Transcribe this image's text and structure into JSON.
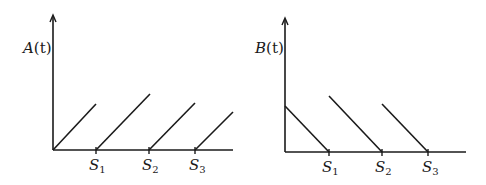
{
  "panels": [
    {
      "id": "A",
      "ylabel": "A(t)",
      "ylabel_main": "A",
      "ylabel_arg": "(t)",
      "ticks": [
        {
          "letter": "S",
          "sub": "1"
        },
        {
          "letter": "S",
          "sub": "2"
        },
        {
          "letter": "S",
          "sub": "3"
        }
      ],
      "description": "Sawtooth rising ramps resetting to zero at each S_i"
    },
    {
      "id": "B",
      "ylabel": "B(t)",
      "ylabel_main": "B",
      "ylabel_arg": "(t)",
      "ticks": [
        {
          "letter": "S",
          "sub": "1"
        },
        {
          "letter": "S",
          "sub": "2"
        },
        {
          "letter": "S",
          "sub": "3"
        }
      ],
      "description": "Decreasing ramps reaching zero at each S_i"
    }
  ],
  "colors": {
    "stroke": "#1a1a1a",
    "background": "#ffffff"
  }
}
